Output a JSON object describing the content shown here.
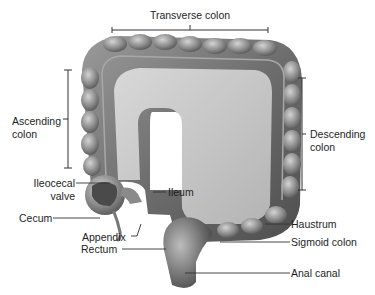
{
  "diagram": {
    "style": "grayscale illustration",
    "colors": {
      "background": "#ffffff",
      "tissue_dark": "#5a5a5a",
      "tissue_mid": "#8c8c8c",
      "tissue_light": "#c8c8c8",
      "label_text": "#1e1e1e",
      "leader_line": "#333333"
    },
    "labels": {
      "transverse_colon": "Transverse colon",
      "ascending_colon_1": "Ascending",
      "ascending_colon_2": "colon",
      "descending_colon_1": "Descending",
      "descending_colon_2": "colon",
      "ileocecal_valve_1": "Ileocecal",
      "ileocecal_valve_2": "valve",
      "ileum": "Ileum",
      "cecum": "Cecum",
      "appendix": "Appendix",
      "rectum": "Rectum",
      "haustrum": "Haustrum",
      "sigmoid_colon": "Sigmoid colon",
      "anal_canal": "Anal canal"
    }
  }
}
